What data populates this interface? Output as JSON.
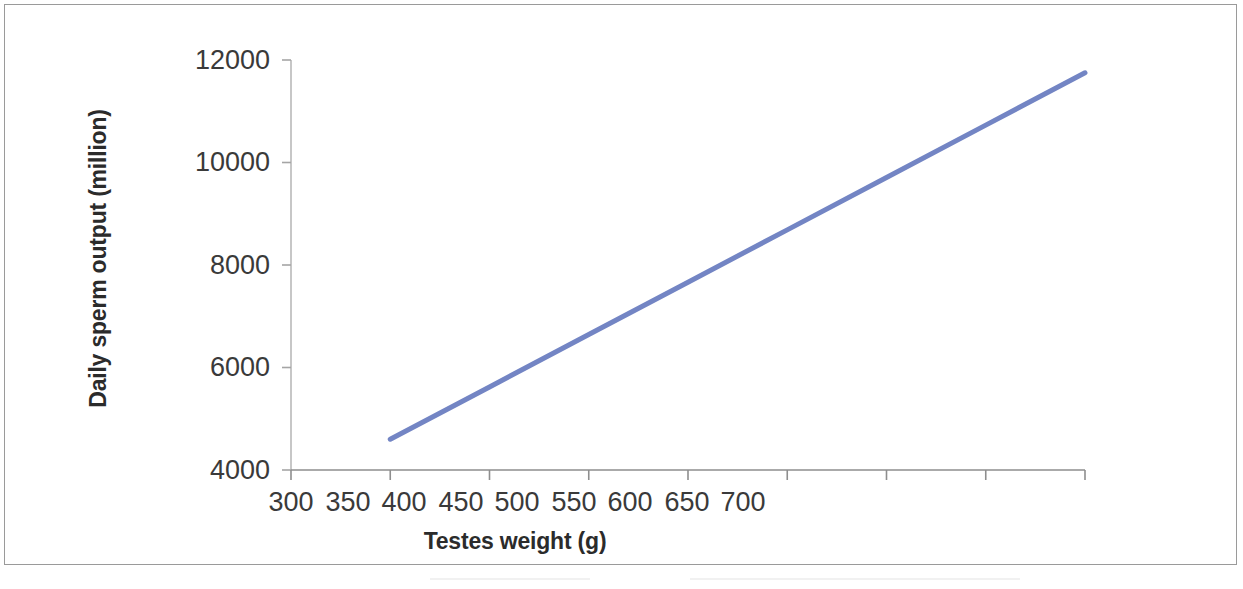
{
  "figure": {
    "border_color": "#9a9a9a",
    "background": "#ffffff"
  },
  "chart_data": {
    "type": "line",
    "title": "",
    "xlabel": "Testes weight (g)",
    "ylabel": "Daily sperm output (million)",
    "xlim": [
      300,
      700
    ],
    "ylim": [
      4000,
      12000
    ],
    "xticks": [
      300,
      350,
      400,
      450,
      500,
      550,
      600,
      650,
      700
    ],
    "xtick_labels": [
      "300",
      "350",
      "400",
      "450",
      "500",
      "550",
      "600",
      "650",
      "700"
    ],
    "yticks": [
      4000,
      6000,
      8000,
      10000,
      12000
    ],
    "ytick_labels": [
      "4000",
      "6000",
      "8000",
      "10000",
      "12000"
    ],
    "grid": false,
    "legend": false,
    "line_color": "#7385c4",
    "line_width": 5,
    "series": [
      {
        "name": "Daily sperm output",
        "x": [
          350,
          400,
          450,
          500,
          550,
          600,
          650,
          700
        ],
        "values": [
          4600,
          5621,
          6643,
          7664,
          8686,
          9707,
          10729,
          11750
        ]
      }
    ],
    "annotations": []
  }
}
